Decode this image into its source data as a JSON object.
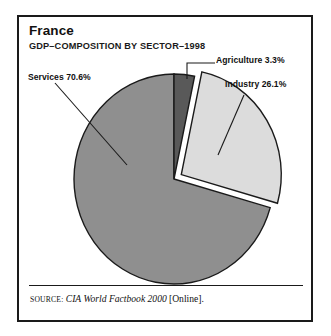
{
  "figure": {
    "title": "France",
    "subtitle": "GDP–COMPOSITION BY SECTOR–1998",
    "source": {
      "label": "Source:",
      "work": "CIA World Factbook 2000",
      "suffix": "[Online]."
    }
  },
  "labels": {
    "services": "Services 70.6%",
    "agriculture": "Agriculture 3.3%",
    "industry": "Industry 26.1%"
  },
  "colors": {
    "services_fill": "#8f8f8f",
    "industry_fill": "#dcdcdc",
    "agriculture_fill": "#595959",
    "outline": "#1a1a1a",
    "frame": "#1a1a1a",
    "background": "#ffffff",
    "text": "#111111"
  },
  "chart_data": {
    "type": "pie",
    "title": "France",
    "subtitle": "GDP–COMPOSITION BY SECTOR–1998",
    "unit": "percent",
    "total": 100,
    "start_angle_deg": 0,
    "direction": "clockwise",
    "legend_position": "callout-labels",
    "grid": false,
    "categories": [
      "Agriculture",
      "Industry",
      "Services"
    ],
    "values": [
      3.3,
      26.1,
      70.6
    ],
    "slices": [
      {
        "name": "Agriculture",
        "value": 3.3,
        "label": "Agriculture 3.3%",
        "color": "#595959",
        "exploded": false,
        "start_deg": 0,
        "end_deg": 11.88
      },
      {
        "name": "Industry",
        "value": 26.1,
        "label": "Industry 26.1%",
        "color": "#dcdcdc",
        "exploded": true,
        "start_deg": 11.88,
        "end_deg": 105.84
      },
      {
        "name": "Services",
        "value": 70.6,
        "label": "Services 70.6%",
        "color": "#8f8f8f",
        "exploded": false,
        "start_deg": 105.84,
        "end_deg": 360
      }
    ]
  }
}
